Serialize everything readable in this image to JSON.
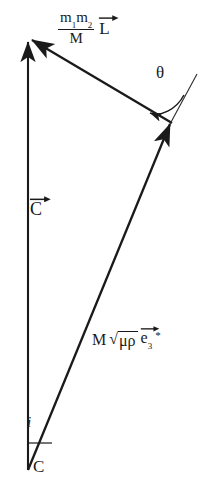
{
  "figure": {
    "background_color": "#ffffff",
    "line_color": "#1a1a1a",
    "width": 205,
    "height": 490
  },
  "labels": {
    "orbital_angular_momentum": {
      "numerator_m1": "m",
      "numerator_sub1": "1",
      "numerator_m2": "m",
      "numerator_sub2": "2",
      "denominator": "M",
      "vector_symbol": "L",
      "full_text": "m1m2/M L"
    },
    "theta": "θ",
    "total_angular_momentum": {
      "vector_symbol": "C",
      "full_text": "C"
    },
    "spin_vector": {
      "prefactor": "M",
      "radical_sign": "√",
      "radicand": "μρ",
      "vector_symbol": "e",
      "subscript": "3",
      "star": "*",
      "full_text": "M √(μρ) e3*"
    },
    "inclination": "i",
    "c_axis": "C"
  },
  "geometry": {
    "apex_top": [
      28,
      38
    ],
    "vertex_bottom": [
      28,
      470
    ],
    "vertex_right": [
      172,
      123
    ],
    "extension_end": [
      196,
      77
    ],
    "theta_arc_from": [
      146,
      112
    ],
    "theta_arc_to": [
      182,
      98
    ],
    "i_tick_from": [
      28,
      444
    ],
    "i_tick_to": [
      52,
      444
    ]
  },
  "colors": {
    "stroke": "#1a1a1a",
    "background": "#ffffff",
    "thin_stroke": "#2a2a2a"
  }
}
